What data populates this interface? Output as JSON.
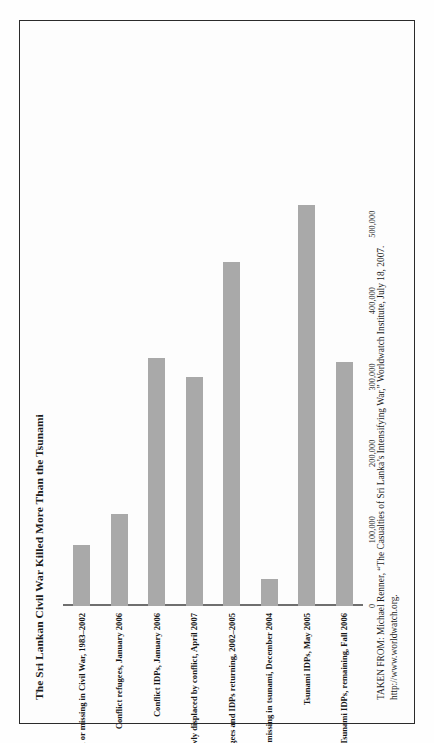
{
  "figure": {
    "title": "The Sri Lankan Civil War Killed More Than the Tsunami",
    "bar_color": "#a9a9a9",
    "axis_color": "#6f6f6f",
    "frame_color": "#2b2b2b"
  },
  "footnote": {
    "line1": "TAKEN FROM: Michael Renner, “The Casualties of Sri Lanka’s Intensifying War,” Worldwatch Institute, July 18, 2007.",
    "line2": "http://www.worldwatch.org."
  },
  "chart_data": {
    "type": "bar",
    "orientation": "vertical",
    "title": "The Sri Lankan Civil War Killed More Than the Tsunami",
    "xlabel": "",
    "ylabel": "",
    "ylim": [
      0,
      550000
    ],
    "grid": false,
    "legend": false,
    "tick_labels": [
      "0",
      "100,000",
      "200,000",
      "300,000",
      "400,000",
      "500,000"
    ],
    "ticks": [
      0,
      100000,
      200000,
      300000,
      400000,
      500000
    ],
    "categories": [
      "Killed or missing in Civil War, 1983–2002",
      "Conflict refugees, January 2006",
      "Conflict IDPs, January 2006",
      "Newly displaced by conflict, April 2007",
      "Refugees and IDPs returning, 2002–2005",
      "Killed or missing in tsunami, December 2004",
      "Tsunami IDPs, May 2005",
      "Tsunami IDPs, remaining, Fall 2006"
    ],
    "values": [
      80000,
      120000,
      325000,
      300000,
      450000,
      35000,
      525000,
      320000
    ]
  }
}
